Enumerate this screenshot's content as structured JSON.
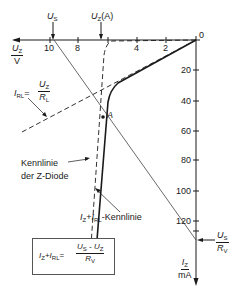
{
  "diagram": {
    "axes": {
      "x": {
        "label_num": "U",
        "label_sub": "Z",
        "label_den": "V",
        "ticks": [
          "10",
          "8",
          "4",
          "2",
          "0"
        ]
      },
      "y": {
        "label_num": "I",
        "label_sub": "Z",
        "label_den": "mA",
        "ticks": [
          "20",
          "40",
          "60",
          "80",
          "100",
          "120"
        ]
      }
    },
    "markers": {
      "us": {
        "sym": "U",
        "sub": "S"
      },
      "uz_a": {
        "sym": "U",
        "sub": "Z",
        "suffix": "(A)"
      },
      "us_rv": {
        "num_sym": "U",
        "num_sub": "S",
        "den_sym": "R",
        "den_sub": "V"
      },
      "point_a": "A"
    },
    "annotations": {
      "irl": {
        "sym": "I",
        "sub": "RL",
        "eq": "=",
        "num_sym": "U",
        "num_sub": "Z",
        "den_sym": "R",
        "den_sub": "L"
      },
      "zdiode_line1": "Kennlinie",
      "zdiode_line2": "der Z-Diode",
      "sum_curve": {
        "i1": "I",
        "s1": "Z",
        "plus": "+",
        "i2": "I",
        "s2": "RL",
        "suffix": "-Kennlinie"
      }
    },
    "formula": {
      "lhs_i1": "I",
      "lhs_s1": "Z",
      "plus": "+",
      "lhs_i2": "I",
      "lhs_s2": "RL",
      "eq": "=",
      "num": "U",
      "num_s1": "S",
      "minus": " - ",
      "num2": "U",
      "num_s2": "Z",
      "den": "R",
      "den_s": "V"
    },
    "colors": {
      "line": "#1a1a1a",
      "thin": "#444444"
    }
  }
}
